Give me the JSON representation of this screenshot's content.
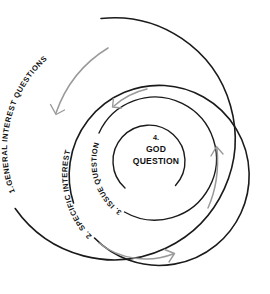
{
  "diagram": {
    "background_color": "#ffffff",
    "ring_stroke_color": "#1a1a1a",
    "arrow_color": "#9a9a9a",
    "text_color": "#111111",
    "rings": [
      {
        "index": 1,
        "label": "1.GENERAL INTEREST QUESTIONS",
        "label_position": "left-outer-arc"
      },
      {
        "index": 2,
        "label": "2. SPECIFIC INTEREST QUESTIONS",
        "label_position": "lower-left-arc"
      },
      {
        "index": 3,
        "label": "3. ISSUE QUESTIONS",
        "label_position": "lower-left-inner-arc"
      }
    ],
    "core": {
      "number": "4.",
      "line1": "GOD",
      "line2": "QUESTION"
    },
    "arrows": [
      {
        "name": "outer-arrow-top-left",
        "direction": "down-left"
      },
      {
        "name": "inner-arrow-top-left",
        "direction": "down-left"
      },
      {
        "name": "arrow-right",
        "direction": "up"
      },
      {
        "name": "arrow-bottom",
        "direction": "right"
      }
    ]
  }
}
